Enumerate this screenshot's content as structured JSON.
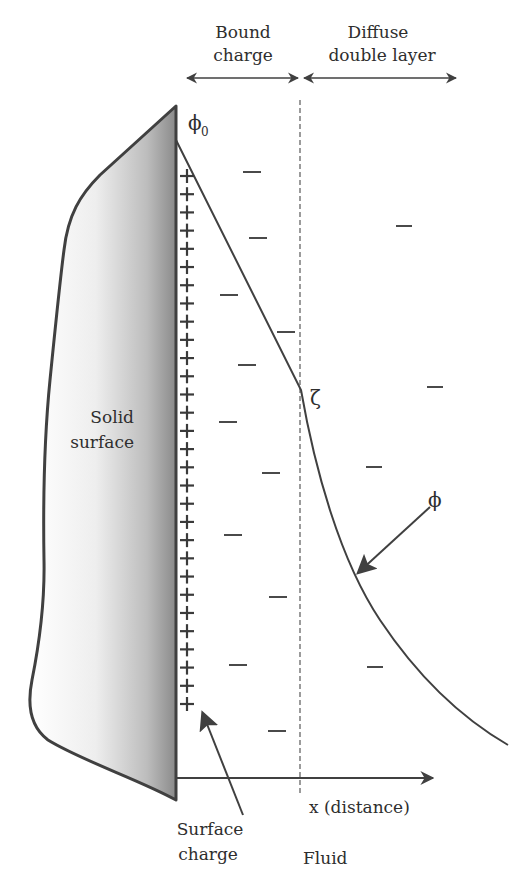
{
  "diagram": {
    "colors": {
      "line": "#404040",
      "text": "#2e2e2e",
      "solid_gradient_light": "#ffffff",
      "solid_gradient_dark": "#8a8a8a",
      "dashed": "#666666"
    },
    "regions": {
      "bound_charge": {
        "line1": "Bound",
        "line2": "charge"
      },
      "diffuse_layer": {
        "line1": "Diffuse",
        "line2": "double layer"
      }
    },
    "solid": {
      "line1": "Solid",
      "line2": "surface"
    },
    "labels": {
      "phi0": "ϕ",
      "phi0_sub": "0",
      "zeta": "ζ",
      "phi": "ϕ",
      "x_axis": "x (distance)",
      "surface_charge_line1": "Surface",
      "surface_charge_line2": "charge",
      "fluid": "Fluid"
    },
    "charges": {
      "plus_symbol": "+",
      "plus_count": 30,
      "minus_symbol": "—",
      "minus_count": 15
    }
  }
}
